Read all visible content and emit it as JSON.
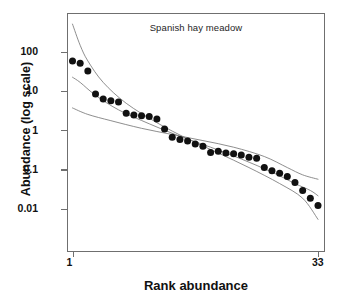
{
  "chart_data": {
    "type": "scatter",
    "title": "Spanish hay meadow",
    "xlabel": "Rank abundance",
    "ylabel": "Abundance (log scale)",
    "yscale": "log",
    "xlim": [
      1,
      33
    ],
    "ylim": [
      0.0035,
      950
    ],
    "grid": false,
    "legend": null,
    "xtick_labels": [
      "1",
      "33"
    ],
    "xtick_values": [
      1,
      33
    ],
    "ytick_labels": [
      "100",
      "10",
      "1",
      "0.1",
      "0.01"
    ],
    "ytick_values": [
      100,
      10,
      1,
      0.1,
      0.01
    ],
    "series": [
      {
        "name": "observed rank abundance",
        "type": "scatter",
        "marker": "filled-circle",
        "color": "#111111",
        "x": [
          1,
          2,
          3,
          4,
          5,
          6,
          7,
          8,
          9,
          10,
          11,
          12,
          13,
          14,
          15,
          16,
          17,
          18,
          19,
          20,
          21,
          22,
          23,
          24,
          25,
          26,
          27,
          28,
          29,
          30,
          31,
          32,
          33
        ],
        "y": [
          60,
          52,
          33,
          8.6,
          6.4,
          5.8,
          5.4,
          2.8,
          2.5,
          2.4,
          2.3,
          2.0,
          1.1,
          0.68,
          0.6,
          0.55,
          0.46,
          0.4,
          0.28,
          0.3,
          0.27,
          0.26,
          0.24,
          0.21,
          0.2,
          0.115,
          0.095,
          0.082,
          0.068,
          0.048,
          0.03,
          0.019,
          0.0125
        ]
      },
      {
        "name": "fitted model curve 1 (steep log-series)",
        "type": "line",
        "color": "#7a7a7a",
        "x": [
          1,
          2,
          3,
          5,
          8,
          12,
          16,
          20,
          24,
          28,
          31,
          33
        ],
        "y": [
          520,
          150,
          60,
          17,
          5.0,
          1.6,
          0.62,
          0.27,
          0.115,
          0.045,
          0.019,
          0.0055
        ]
      },
      {
        "name": "fitted model curve 2 (log-normal)",
        "type": "line",
        "color": "#7a7a7a",
        "x": [
          1,
          2,
          4,
          7,
          11,
          15,
          19,
          23,
          27,
          30,
          32,
          33
        ],
        "y": [
          23,
          17,
          8.0,
          3.4,
          1.5,
          0.72,
          0.38,
          0.19,
          0.088,
          0.045,
          0.03,
          0.022
        ]
      },
      {
        "name": "fitted model curve 3 (broken stick)",
        "type": "line",
        "color": "#7a7a7a",
        "x": [
          1,
          3,
          6,
          10,
          14,
          18,
          22,
          26,
          29,
          31,
          33
        ],
        "y": [
          3.8,
          2.6,
          1.8,
          1.15,
          0.8,
          0.56,
          0.38,
          0.22,
          0.115,
          0.075,
          0.058
        ]
      }
    ]
  },
  "axes": {
    "y_title": "Abundance (log scale)",
    "x_title": "Rank abundance",
    "y_ticks": [
      {
        "label": "100",
        "value": 100
      },
      {
        "label": "10",
        "value": 10
      },
      {
        "label": "1",
        "value": 1
      },
      {
        "label": "0.1",
        "value": 0.1
      },
      {
        "label": "0.01",
        "value": 0.01
      }
    ],
    "x_ticks": [
      {
        "label": "1",
        "value": 1
      },
      {
        "label": "33",
        "value": 33
      }
    ]
  },
  "colors": {
    "marker": "#111111",
    "curve": "#7a7a7a",
    "frame": "#6f6f6f",
    "background": "#ffffff",
    "text": "#111111"
  }
}
